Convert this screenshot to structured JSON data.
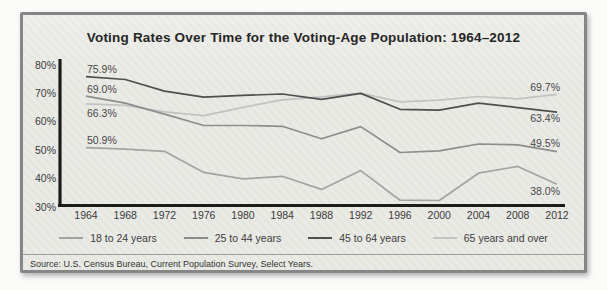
{
  "card": {
    "title": "Voting Rates Over Time for the Voting-Age Population: 1964–2012",
    "source": "Source: U.S. Census Bureau, Current Population Survey, Select Years."
  },
  "chart_data": {
    "type": "line",
    "title": "Voting Rates Over Time for the Voting-Age Population: 1964–2012",
    "x": [
      1964,
      1968,
      1972,
      1976,
      1980,
      1984,
      1988,
      1992,
      1996,
      2000,
      2004,
      2008,
      2012
    ],
    "xlabel": "",
    "ylabel": "",
    "ylim": [
      30,
      80
    ],
    "yticks": [
      80,
      70,
      60,
      50,
      40,
      30
    ],
    "ytick_suffix": "%",
    "grid": false,
    "legend_position": "bottom",
    "axis_color": "#1c1c1c",
    "series": [
      {
        "name": "18 to 24 years",
        "color": "#a3a3a3",
        "values": [
          50.9,
          50.4,
          49.6,
          42.2,
          39.9,
          40.8,
          36.2,
          42.8,
          32.4,
          32.3,
          41.9,
          44.3,
          38.0
        ],
        "start_label": "50.9%",
        "end_label": "38.0%"
      },
      {
        "name": "25 to 44 years",
        "color": "#8d8d8d",
        "values": [
          69.0,
          66.6,
          62.7,
          58.7,
          58.7,
          58.4,
          54.0,
          58.3,
          49.2,
          49.8,
          52.2,
          51.9,
          49.5
        ],
        "start_label": "69.0%",
        "end_label": "49.5%"
      },
      {
        "name": "45 to 64 years",
        "color": "#4f4f4f",
        "values": [
          75.9,
          74.9,
          70.8,
          68.7,
          69.3,
          69.8,
          67.9,
          70.0,
          64.4,
          64.1,
          66.6,
          65.0,
          63.4
        ],
        "start_label": "75.9%",
        "end_label": "63.4%"
      },
      {
        "name": "65 years and over",
        "color": "#c2c2c2",
        "values": [
          66.3,
          65.8,
          63.5,
          62.2,
          65.1,
          67.7,
          68.8,
          70.1,
          67.0,
          67.6,
          68.9,
          68.1,
          69.7
        ],
        "start_label": "66.3%",
        "end_label": "69.7%"
      }
    ]
  }
}
